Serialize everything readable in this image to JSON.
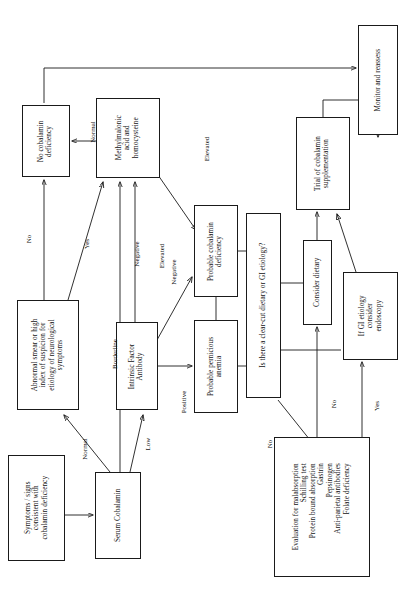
{
  "diagram": {
    "orientation": "rotated-90-ccw",
    "nodes": [
      {
        "id": "symptoms",
        "label": "Symptoms / signs\nconsistent with\ncobalamin deficiency",
        "x": 8,
        "y": 455,
        "w": 57,
        "h": 106
      },
      {
        "id": "serum-cobalamin",
        "label": "Serum Cobalamin",
        "x": 95,
        "y": 472,
        "w": 46,
        "h": 87
      },
      {
        "id": "abnormal-smear",
        "label": "Abnormal smear or high\nindex of suspicion for\netiology of neurological\nsymptoms",
        "x": 17,
        "y": 300,
        "w": 62,
        "h": 110
      },
      {
        "id": "intrinsic-factor",
        "label": "Intrinsic Factor\nAntibody",
        "x": 116,
        "y": 322,
        "w": 42,
        "h": 88
      },
      {
        "id": "mma-homocysteine",
        "label": "Methylmalonic\nacid and\nhomocysteine",
        "x": 96,
        "y": 98,
        "w": 64,
        "h": 80
      },
      {
        "id": "no-cobalamin-deficiency",
        "label": "No cobalamin\ndeficiency",
        "x": 22,
        "y": 105,
        "w": 48,
        "h": 72
      },
      {
        "id": "probable-cobalamin-deficiency",
        "label": "Probable cobalamin\ndeficiency",
        "x": 194,
        "y": 205,
        "w": 44,
        "h": 92
      },
      {
        "id": "probable-pernicious-anemia",
        "label": "Probable pernicious\nanemia",
        "x": 194,
        "y": 320,
        "w": 44,
        "h": 93
      },
      {
        "id": "clear-cut-etiology",
        "label": "Is there a clear-cut dietary or GI etiology?",
        "x": 246,
        "y": 213,
        "w": 35,
        "h": 185
      },
      {
        "id": "evaluation-malabsorption",
        "label": "Evaluation for malabsorption\nSchilling test\nProtein bound absorption\nGastrin\nPepsinogen\nAnti-parietal antibodies\nFolate deficiency",
        "x": 274,
        "y": 437,
        "w": 96,
        "h": 140
      },
      {
        "id": "consider-dietary",
        "label": "Consider dietary",
        "x": 303,
        "y": 240,
        "w": 29,
        "h": 85
      },
      {
        "id": "gi-etiology-endoscopy",
        "label": "If GI etiology\nconsider\nendoscopy",
        "x": 343,
        "y": 272,
        "w": 55,
        "h": 88
      },
      {
        "id": "trial-supplementation",
        "label": "Trial of cobalamin\nsupplementation",
        "x": 296,
        "y": 117,
        "w": 54,
        "h": 93
      },
      {
        "id": "monitor-reassess",
        "label": "Monitor and reassess",
        "x": 358,
        "y": 25,
        "w": 40,
        "h": 110
      }
    ],
    "edge_labels": [
      {
        "id": "normal-serum",
        "text": "Normal",
        "x": 74,
        "y": 445
      },
      {
        "id": "low-serum",
        "text": "Low",
        "x": 142,
        "y": 440
      },
      {
        "id": "borderline-serum",
        "text": "Borderline",
        "x": 106,
        "y": 350
      },
      {
        "id": "no-abnormal",
        "text": "No",
        "x": 25,
        "y": 235
      },
      {
        "id": "yes-abnormal",
        "text": "Yes",
        "x": 82,
        "y": 240
      },
      {
        "id": "negative-if-mma",
        "text": "Negative",
        "x": 129,
        "y": 250
      },
      {
        "id": "negative-if-probable",
        "text": "Negative",
        "x": 166,
        "y": 268
      },
      {
        "id": "positive-if",
        "text": "Positive",
        "x": 178,
        "y": 398
      },
      {
        "id": "elevated-mma-left",
        "text": "Elevated",
        "x": 155,
        "y": 252
      },
      {
        "id": "elevated-mma-right",
        "text": "Elevated",
        "x": 200,
        "y": 145
      },
      {
        "id": "normal-mma",
        "text": "Normal",
        "x": 86,
        "y": 130
      },
      {
        "id": "no-clearcut",
        "text": "No",
        "x": 266,
        "y": 440
      },
      {
        "id": "no-eval-consider",
        "text": "No",
        "x": 330,
        "y": 400
      },
      {
        "id": "yes-eval-endoscopy",
        "text": "Yes",
        "x": 372,
        "y": 402
      }
    ]
  }
}
